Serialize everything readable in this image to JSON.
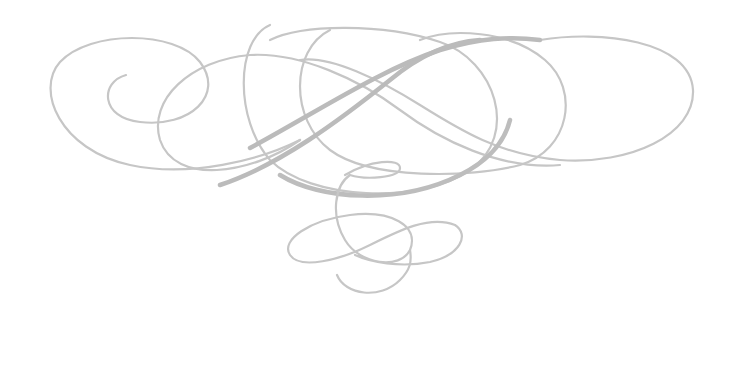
{
  "image": {
    "description": "Decorative calligraphic flourish ornament",
    "background": "#ffffff",
    "stroke_color": "#c4c4c4",
    "stroke_color_dark": "#b8b8b8"
  }
}
